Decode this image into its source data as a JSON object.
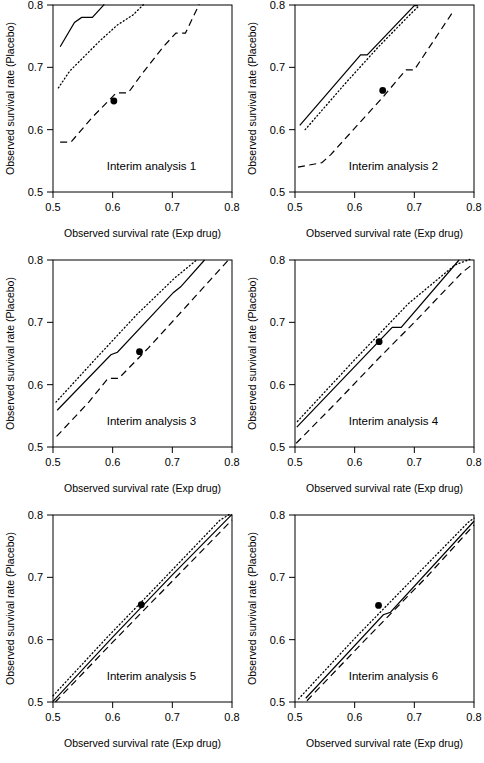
{
  "figure": {
    "kind": "small-multiples-line-plot-grid",
    "rows": 3,
    "cols": 2,
    "background": "#ffffff",
    "ink": "#000000"
  },
  "axes": {
    "xlabel": "Observed survival rate (Exp drug)",
    "ylabel": "Observed survival rate (Placebo)",
    "xlim": [
      0.5,
      0.8
    ],
    "ylim": [
      0.5,
      0.8
    ],
    "xticks": [
      0.5,
      0.6,
      0.7,
      0.8
    ],
    "yticks": [
      0.5,
      0.6,
      0.7,
      0.8
    ],
    "xticklabels": [
      "0.5",
      "0.6",
      "0.7",
      "0.8"
    ],
    "yticklabels": [
      "0.5",
      "0.6",
      "0.7",
      "0.8"
    ],
    "grid": false,
    "box": true
  },
  "series_styles": {
    "solid": {
      "name": "solid-boundary",
      "dash": "none",
      "width": 1.2
    },
    "dotted": {
      "name": "dotted-boundary",
      "dash": "1,2.6",
      "width": 1.3
    },
    "dashed": {
      "name": "dashed-boundary",
      "dash": "7,4.5",
      "width": 1.2
    },
    "point": {
      "name": "observed-point",
      "marker": "filled-circle",
      "radius": 3.4
    }
  },
  "chart_data": {
    "type": "line",
    "title": "",
    "xlabel": "Observed survival rate (Exp drug)",
    "ylabel": "Observed survival rate (Placebo)",
    "xlim": [
      0.5,
      0.8
    ],
    "ylim": [
      0.5,
      0.8
    ],
    "grid": false,
    "legend": "none",
    "panels": [
      {
        "label": "Interim analysis 1",
        "point": {
          "x": 0.602,
          "y": 0.646
        },
        "series": [
          {
            "name": "solid-boundary",
            "style": "solid",
            "x": [
              0.512,
              0.536,
              0.548,
              0.566,
              0.586
            ],
            "y": [
              0.733,
              0.772,
              0.78,
              0.78,
              0.801
            ]
          },
          {
            "name": "dotted-boundary",
            "style": "dotted",
            "x": [
              0.509,
              0.528,
              0.552,
              0.578,
              0.608,
              0.634,
              0.652
            ],
            "y": [
              0.667,
              0.694,
              0.717,
              0.742,
              0.768,
              0.784,
              0.801
            ]
          },
          {
            "name": "dashed-boundary",
            "style": "dashed",
            "x": [
              0.512,
              0.53,
              0.566,
              0.606,
              0.626,
              0.648,
              0.684,
              0.706,
              0.722,
              0.745
            ],
            "y": [
              0.58,
              0.58,
              0.62,
              0.659,
              0.659,
              0.688,
              0.732,
              0.755,
              0.755,
              0.801
            ]
          }
        ]
      },
      {
        "label": "Interim analysis 2",
        "point": {
          "x": 0.647,
          "y": 0.663
        },
        "series": [
          {
            "name": "solid-boundary",
            "style": "solid",
            "x": [
              0.508,
              0.61,
              0.621,
              0.7,
              0.706
            ],
            "y": [
              0.607,
              0.72,
              0.72,
              0.799,
              0.799
            ]
          },
          {
            "name": "dotted-boundary",
            "style": "dotted",
            "x": [
              0.517,
              0.586,
              0.64,
              0.69,
              0.706
            ],
            "y": [
              0.6,
              0.676,
              0.733,
              0.782,
              0.797
            ]
          },
          {
            "name": "dashed-boundary",
            "style": "dashed",
            "x": [
              0.505,
              0.545,
              0.56,
              0.648,
              0.686,
              0.7,
              0.766
            ],
            "y": [
              0.54,
              0.547,
              0.56,
              0.653,
              0.696,
              0.696,
              0.791
            ]
          }
        ]
      },
      {
        "label": "Interim analysis 3",
        "point": {
          "x": 0.645,
          "y": 0.653
        },
        "series": [
          {
            "name": "solid-boundary",
            "style": "solid",
            "x": [
              0.507,
              0.597,
              0.608,
              0.702,
              0.714,
              0.754
            ],
            "y": [
              0.559,
              0.648,
              0.652,
              0.748,
              0.757,
              0.8
            ]
          },
          {
            "name": "dotted-boundary",
            "style": "dotted",
            "x": [
              0.505,
              0.57,
              0.64,
              0.705,
              0.742
            ],
            "y": [
              0.572,
              0.64,
              0.712,
              0.772,
              0.801
            ]
          },
          {
            "name": "dashed-boundary",
            "style": "dashed",
            "x": [
              0.506,
              0.56,
              0.592,
              0.61,
              0.66,
              0.72,
              0.794
            ],
            "y": [
              0.517,
              0.572,
              0.61,
              0.61,
              0.659,
              0.722,
              0.8
            ]
          }
        ]
      },
      {
        "label": "Interim analysis 4",
        "point": {
          "x": 0.641,
          "y": 0.669
        },
        "series": [
          {
            "name": "solid-boundary",
            "style": "solid",
            "x": [
              0.503,
              0.663,
              0.678,
              0.775
            ],
            "y": [
              0.532,
              0.692,
              0.692,
              0.8
            ]
          },
          {
            "name": "dotted-boundary",
            "style": "dotted",
            "x": [
              0.504,
              0.6,
              0.69,
              0.768,
              0.793
            ],
            "y": [
              0.541,
              0.64,
              0.73,
              0.792,
              0.801
            ]
          },
          {
            "name": "dashed-boundary",
            "style": "dashed",
            "x": [
              0.502,
              0.57,
              0.64,
              0.7,
              0.78,
              0.795
            ],
            "y": [
              0.506,
              0.572,
              0.642,
              0.7,
              0.78,
              0.791
            ]
          }
        ]
      },
      {
        "label": "Interim analysis 5",
        "point": {
          "x": 0.648,
          "y": 0.656
        },
        "series": [
          {
            "name": "solid-boundary",
            "style": "solid",
            "x": [
              0.5,
              0.6,
              0.7,
              0.8
            ],
            "y": [
              0.501,
              0.604,
              0.704,
              0.801
            ]
          },
          {
            "name": "dotted-boundary",
            "style": "dotted",
            "x": [
              0.5,
              0.59,
              0.68,
              0.78,
              0.796
            ],
            "y": [
              0.51,
              0.603,
              0.692,
              0.792,
              0.801
            ]
          },
          {
            "name": "dashed-boundary",
            "style": "dashed",
            "x": [
              0.504,
              0.6,
              0.7,
              0.8
            ],
            "y": [
              0.5,
              0.596,
              0.694,
              0.792
            ]
          }
        ]
      },
      {
        "label": "Interim analysis 6",
        "point": {
          "x": 0.64,
          "y": 0.655
        },
        "series": [
          {
            "name": "solid-boundary",
            "style": "solid",
            "x": [
              0.518,
              0.648,
              0.66,
              0.8
            ],
            "y": [
              0.506,
              0.64,
              0.644,
              0.79
            ]
          },
          {
            "name": "dotted-boundary",
            "style": "dotted",
            "x": [
              0.506,
              0.6,
              0.7,
              0.79,
              0.8
            ],
            "y": [
              0.505,
              0.602,
              0.7,
              0.788,
              0.795
            ]
          },
          {
            "name": "dashed-boundary",
            "style": "dashed",
            "x": [
              0.52,
              0.62,
              0.72,
              0.8
            ],
            "y": [
              0.502,
              0.602,
              0.7,
              0.784
            ]
          }
        ]
      }
    ]
  }
}
